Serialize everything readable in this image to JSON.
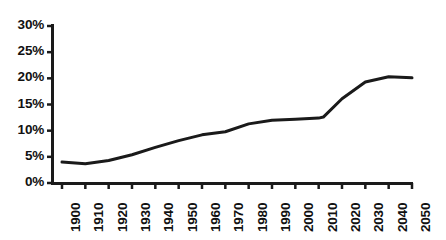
{
  "chart_data": {
    "type": "line",
    "title": "",
    "subtitle": "",
    "xlabel": "",
    "ylabel": "",
    "legend": [],
    "legend_position": "none",
    "grid": false,
    "xlim": [
      1900,
      2050
    ],
    "ylim": [
      0,
      30
    ],
    "y_tick_suffix": "%",
    "x_tick_labels": [
      "1900",
      "1910",
      "1920",
      "1930",
      "1940",
      "1950",
      "1960",
      "1970",
      "1980",
      "1990",
      "2000",
      "2010",
      "2020",
      "2030",
      "2040",
      "2050"
    ],
    "y_tick_labels": [
      "0%",
      "5%",
      "10%",
      "15%",
      "20%",
      "25%",
      "30%"
    ],
    "y_tick_values": [
      0,
      5,
      10,
      15,
      20,
      25,
      30
    ],
    "x": [
      1900,
      1910,
      1920,
      1930,
      1940,
      1950,
      1960,
      1970,
      1980,
      1990,
      2000,
      2010,
      2012,
      2020,
      2030,
      2040,
      2050
    ],
    "values": [
      4.0,
      3.7,
      4.3,
      5.4,
      6.8,
      8.1,
      9.2,
      9.8,
      11.3,
      12.0,
      12.2,
      12.4,
      12.6,
      16.1,
      19.3,
      20.3,
      20.1
    ],
    "series": [
      {
        "name": "percent",
        "color": "#1a1a1a",
        "line_width": 3,
        "values": [
          4.0,
          3.7,
          4.3,
          5.4,
          6.8,
          8.1,
          9.2,
          9.8,
          11.3,
          12.0,
          12.2,
          12.4,
          12.6,
          16.1,
          19.3,
          20.3,
          20.1
        ]
      }
    ],
    "annotations": [],
    "axis_color": "#1a1a1a",
    "background_color": "#ffffff"
  },
  "geometry": {
    "plot_left": 62,
    "plot_right": 412,
    "plot_top": 26,
    "plot_bottom": 183,
    "axis_x": 52,
    "y_tick_top": 26,
    "y_tick_bottom": 183
  }
}
